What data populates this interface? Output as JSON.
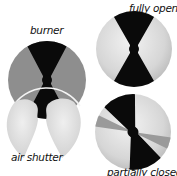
{
  "diagram": {
    "labels": {
      "burner": "burner",
      "air_shutter": "air shutter",
      "fully_open": "fully open",
      "partially_closed": "partially closed"
    },
    "colors": {
      "background": "#ffffff",
      "black_vane": "#0a0a0a",
      "burner_gray": "#8e8e8e",
      "shutter_light": "#dcdcdc",
      "shutter_highlight": "#f0f0f0",
      "shutter_mid": "#9a9a9a",
      "rim": "#f4f4f4"
    },
    "components": [
      {
        "id": "burner",
        "label": "burner",
        "shape": "circle",
        "cx": 47,
        "cy": 80,
        "r": 39
      },
      {
        "id": "air-shutter",
        "label": "air shutter",
        "shape": "two lens petals",
        "cx": 44,
        "cy": 118,
        "r": 40
      },
      {
        "id": "fully-open",
        "label": "fully open",
        "shape": "circle",
        "cx": 134,
        "cy": 49,
        "r": 38,
        "rotation_deg": 0
      },
      {
        "id": "partially-closed",
        "label": "partially closed",
        "shape": "circle",
        "cx": 133,
        "cy": 132,
        "r": 38,
        "rotation_deg": -22
      }
    ]
  }
}
